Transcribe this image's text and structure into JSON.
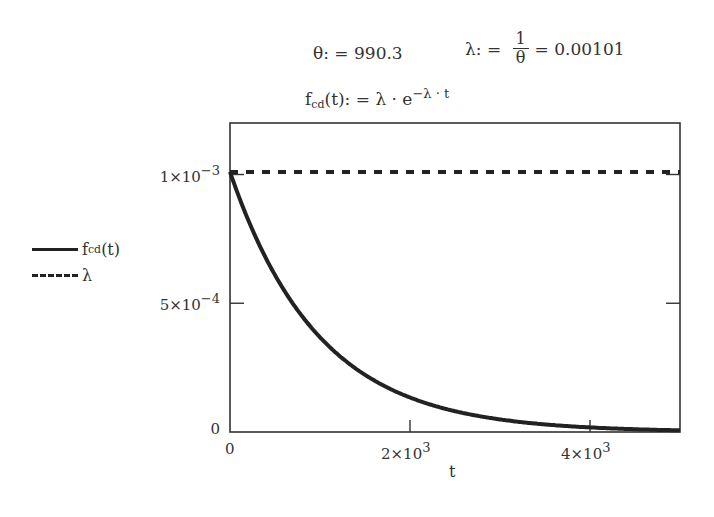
{
  "definitions": {
    "theta_lhs": "θ: = ",
    "theta_value": "990.3",
    "lambda_lhs": "λ: = ",
    "lambda_num": "1",
    "lambda_den": "θ",
    "lambda_result": "= 0.00101",
    "f_name": "f",
    "f_sub": "cd",
    "f_args": "(t): = λ · e",
    "f_exp": "−λ · t"
  },
  "legend": [
    {
      "name": "f",
      "sub": "cd",
      "suffix": "(t)",
      "style": "solid"
    },
    {
      "name": "λ",
      "sub": "",
      "suffix": "",
      "style": "dashed"
    }
  ],
  "axes": {
    "x_ticks": [
      {
        "value": 0,
        "label": "0",
        "mant": "",
        "exp": ""
      },
      {
        "value": 2000,
        "label": "",
        "mant": "2×10",
        "exp": "3"
      },
      {
        "value": 4000,
        "label": "",
        "mant": "4×10",
        "exp": "3"
      }
    ],
    "y_ticks": [
      {
        "value": 0,
        "label": "0",
        "mant": "",
        "exp": ""
      },
      {
        "value": 0.0005,
        "label": "",
        "mant": "5×10",
        "exp": "−4"
      },
      {
        "value": 0.001,
        "label": "",
        "mant": "1×10",
        "exp": "−3"
      }
    ],
    "x_label": "t"
  },
  "colors": {
    "line": "#222222",
    "frame": "#333333"
  },
  "chart_data": {
    "type": "line",
    "title": "",
    "xlabel": "t",
    "ylabel": "",
    "xlim": [
      0,
      5000
    ],
    "ylim": [
      0,
      0.0012
    ],
    "grid": false,
    "legend_position": "left",
    "parameters": {
      "theta": 990.3,
      "lambda": 0.00101
    },
    "series": [
      {
        "name": "f_cd(t)",
        "formula": "lambda * exp(-lambda * t)",
        "style": "solid",
        "x": [
          0,
          500,
          1000,
          1500,
          2000,
          2500,
          3000,
          3500,
          4000,
          4500,
          5000
        ],
        "values": [
          0.00101,
          0.000611,
          0.000368,
          0.000222,
          0.000134,
          8.09e-05,
          4.88e-05,
          2.94e-05,
          1.78e-05,
          1.07e-05,
          6.5e-06
        ]
      },
      {
        "name": "λ",
        "style": "dashed",
        "x": [
          0,
          5000
        ],
        "values": [
          0.00101,
          0.00101
        ]
      }
    ],
    "x_ticks": [
      0,
      2000,
      4000
    ],
    "x_tick_labels": [
      "0",
      "2×10^3",
      "4×10^3"
    ],
    "y_ticks": [
      0,
      0.0005,
      0.001
    ],
    "y_tick_labels": [
      "0",
      "5×10^-4",
      "1×10^-3"
    ]
  }
}
